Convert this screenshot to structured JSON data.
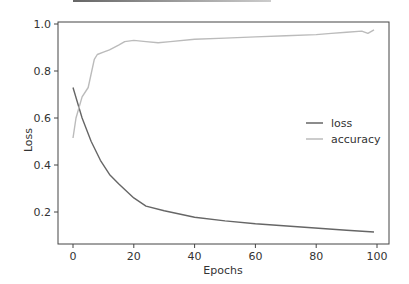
{
  "chart_data": {
    "type": "line",
    "title": "",
    "xlabel": "Epochs",
    "ylabel": "Loss",
    "xlim": [
      -5,
      104
    ],
    "ylim": [
      0.064,
      1.0
    ],
    "xticks": [
      0,
      20,
      40,
      60,
      80,
      100
    ],
    "yticks": [
      0.2,
      0.4,
      0.6,
      0.8,
      1.0
    ],
    "ytick_labels": [
      "0.2",
      "0.4",
      "0.6",
      "0.8",
      "1.0"
    ],
    "xtick_labels": [
      "0",
      "20",
      "40",
      "60",
      "80",
      "100"
    ],
    "grid": false,
    "legend_position": "center right",
    "series": [
      {
        "name": "loss",
        "color": "#666666",
        "x": [
          0,
          3,
          6,
          9,
          12,
          15,
          20,
          24,
          30,
          40,
          50,
          60,
          75,
          90,
          99
        ],
        "values": [
          0.73,
          0.6,
          0.5,
          0.42,
          0.36,
          0.32,
          0.26,
          0.225,
          0.205,
          0.178,
          0.162,
          0.15,
          0.136,
          0.122,
          0.115
        ]
      },
      {
        "name": "accuracy",
        "color": "#bbbbbb",
        "x": [
          0,
          1,
          3,
          5,
          7,
          8,
          10,
          12,
          15,
          17,
          20,
          24,
          28,
          32,
          40,
          50,
          60,
          70,
          80,
          85,
          90,
          95,
          97,
          99
        ],
        "values": [
          0.515,
          0.6,
          0.69,
          0.73,
          0.85,
          0.87,
          0.88,
          0.89,
          0.91,
          0.925,
          0.93,
          0.925,
          0.92,
          0.925,
          0.935,
          0.94,
          0.945,
          0.95,
          0.955,
          0.96,
          0.965,
          0.97,
          0.96,
          0.975
        ]
      }
    ]
  },
  "legend": {
    "items": [
      {
        "label": "loss",
        "color": "#666666"
      },
      {
        "label": "accuracy",
        "color": "#bbbbbb"
      }
    ]
  },
  "axes": {
    "xlabel": "Epochs",
    "ylabel": "Loss"
  }
}
